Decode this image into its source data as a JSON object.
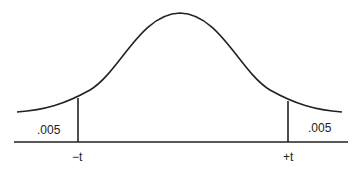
{
  "diagram": {
    "type": "t-distribution two-tailed",
    "left_tail_area": ".005",
    "right_tail_area": ".005",
    "left_critical": "−t",
    "right_critical": "+t"
  }
}
